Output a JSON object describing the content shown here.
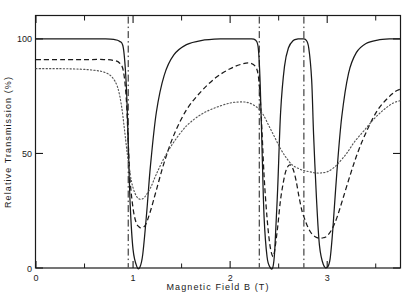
{
  "chart_data": {
    "type": "line",
    "title": "",
    "xlabel": "Magnetic Field B (T)",
    "ylabel": "Relative Transmission (%)",
    "xlim": [
      0,
      3.75
    ],
    "ylim": [
      0,
      110
    ],
    "xticks": [
      0,
      1,
      2,
      3
    ],
    "xticklabels": [
      "0",
      "1",
      "2",
      "3"
    ],
    "xminorticks": [
      0.5,
      1.5,
      2.5,
      3.5
    ],
    "yticks": [
      0,
      50,
      100
    ],
    "yticklabels": [
      "0",
      "50",
      "100"
    ],
    "grid": false,
    "legend": "none",
    "resonance_lines": {
      "style": "dash-dot",
      "values": [
        0.95,
        2.3,
        2.76
      ]
    },
    "series": [
      {
        "name": "solid",
        "style": "solid",
        "color": "#1a1a1a",
        "points": [
          [
            0.0,
            100
          ],
          [
            0.3,
            100
          ],
          [
            0.55,
            100
          ],
          [
            0.7,
            100
          ],
          [
            0.8,
            99.8
          ],
          [
            0.86,
            99.0
          ],
          [
            0.9,
            96
          ],
          [
            0.93,
            80
          ],
          [
            0.95,
            55
          ],
          [
            0.97,
            28
          ],
          [
            1.0,
            8
          ],
          [
            1.04,
            0.5
          ],
          [
            1.07,
            0.3
          ],
          [
            1.1,
            6
          ],
          [
            1.14,
            24
          ],
          [
            1.18,
            45
          ],
          [
            1.24,
            68
          ],
          [
            1.32,
            84
          ],
          [
            1.42,
            93
          ],
          [
            1.55,
            97.5
          ],
          [
            1.7,
            99.3
          ],
          [
            1.9,
            100
          ],
          [
            2.1,
            100
          ],
          [
            2.2,
            100
          ],
          [
            2.26,
            99.5
          ],
          [
            2.29,
            96
          ],
          [
            2.31,
            80
          ],
          [
            2.33,
            50
          ],
          [
            2.35,
            22
          ],
          [
            2.38,
            5
          ],
          [
            2.41,
            0.4
          ],
          [
            2.44,
            0.3
          ],
          [
            2.46,
            8
          ],
          [
            2.49,
            35
          ],
          [
            2.52,
            68
          ],
          [
            2.56,
            88
          ],
          [
            2.6,
            96
          ],
          [
            2.65,
            99.3
          ],
          [
            2.7,
            100
          ],
          [
            2.74,
            100
          ],
          [
            2.78,
            99.6
          ],
          [
            2.81,
            96
          ],
          [
            2.84,
            82
          ],
          [
            2.86,
            58
          ],
          [
            2.89,
            30
          ],
          [
            2.92,
            10
          ],
          [
            2.96,
            1.5
          ],
          [
            3.0,
            0.3
          ],
          [
            3.03,
            4
          ],
          [
            3.06,
            18
          ],
          [
            3.1,
            42
          ],
          [
            3.15,
            66
          ],
          [
            3.22,
            85
          ],
          [
            3.3,
            94
          ],
          [
            3.4,
            98
          ],
          [
            3.52,
            99.5
          ],
          [
            3.65,
            100
          ],
          [
            3.75,
            100
          ]
        ]
      },
      {
        "name": "dashed",
        "style": "dashed",
        "color": "#1a1a1a",
        "points": [
          [
            0.0,
            91
          ],
          [
            0.3,
            91
          ],
          [
            0.55,
            91
          ],
          [
            0.7,
            91
          ],
          [
            0.8,
            90.6
          ],
          [
            0.86,
            89.5
          ],
          [
            0.9,
            86
          ],
          [
            0.93,
            74
          ],
          [
            0.95,
            55
          ],
          [
            0.97,
            38
          ],
          [
            1.0,
            26
          ],
          [
            1.03,
            20
          ],
          [
            1.06,
            18
          ],
          [
            1.09,
            17.5
          ],
          [
            1.13,
            19
          ],
          [
            1.18,
            25
          ],
          [
            1.24,
            34
          ],
          [
            1.32,
            46
          ],
          [
            1.42,
            58
          ],
          [
            1.55,
            69
          ],
          [
            1.7,
            77
          ],
          [
            1.85,
            83
          ],
          [
            2.0,
            87
          ],
          [
            2.12,
            89
          ],
          [
            2.2,
            89.5
          ],
          [
            2.26,
            88
          ],
          [
            2.29,
            84
          ],
          [
            2.31,
            74
          ],
          [
            2.33,
            58
          ],
          [
            2.35,
            40
          ],
          [
            2.38,
            22
          ],
          [
            2.41,
            10
          ],
          [
            2.44,
            5
          ],
          [
            2.46,
            8
          ],
          [
            2.49,
            18
          ],
          [
            2.52,
            30
          ],
          [
            2.56,
            40
          ],
          [
            2.59,
            44
          ],
          [
            2.62,
            45
          ],
          [
            2.65,
            43
          ],
          [
            2.68,
            38
          ],
          [
            2.71,
            31
          ],
          [
            2.74,
            25
          ],
          [
            2.78,
            20
          ],
          [
            2.81,
            17
          ],
          [
            2.84,
            15
          ],
          [
            2.88,
            13.5
          ],
          [
            2.92,
            13
          ],
          [
            2.96,
            13.2
          ],
          [
            3.0,
            14
          ],
          [
            3.05,
            17
          ],
          [
            3.1,
            22
          ],
          [
            3.16,
            30
          ],
          [
            3.24,
            41
          ],
          [
            3.32,
            51
          ],
          [
            3.42,
            61
          ],
          [
            3.52,
            69
          ],
          [
            3.62,
            74
          ],
          [
            3.7,
            77
          ],
          [
            3.75,
            78
          ]
        ]
      },
      {
        "name": "dotted",
        "style": "dotted",
        "color": "#555555",
        "points": [
          [
            0.0,
            87
          ],
          [
            0.25,
            87
          ],
          [
            0.45,
            86.8
          ],
          [
            0.6,
            86.3
          ],
          [
            0.7,
            85.5
          ],
          [
            0.78,
            83.5
          ],
          [
            0.84,
            79
          ],
          [
            0.88,
            71
          ],
          [
            0.91,
            61
          ],
          [
            0.94,
            50
          ],
          [
            0.97,
            41
          ],
          [
            1.0,
            35
          ],
          [
            1.04,
            31
          ],
          [
            1.08,
            30
          ],
          [
            1.12,
            31
          ],
          [
            1.18,
            35
          ],
          [
            1.24,
            41
          ],
          [
            1.32,
            48
          ],
          [
            1.42,
            55
          ],
          [
            1.55,
            62
          ],
          [
            1.7,
            67
          ],
          [
            1.85,
            70
          ],
          [
            2.0,
            72
          ],
          [
            2.12,
            72.5
          ],
          [
            2.2,
            72
          ],
          [
            2.28,
            70
          ],
          [
            2.34,
            67
          ],
          [
            2.4,
            62
          ],
          [
            2.46,
            57
          ],
          [
            2.52,
            52
          ],
          [
            2.58,
            48
          ],
          [
            2.64,
            45
          ],
          [
            2.7,
            43.5
          ],
          [
            2.76,
            42.5
          ],
          [
            2.82,
            42
          ],
          [
            2.88,
            41.5
          ],
          [
            2.94,
            41.5
          ],
          [
            3.0,
            42
          ],
          [
            3.06,
            43.5
          ],
          [
            3.12,
            46
          ],
          [
            3.2,
            50
          ],
          [
            3.28,
            55
          ],
          [
            3.38,
            60
          ],
          [
            3.48,
            65
          ],
          [
            3.58,
            69
          ],
          [
            3.68,
            72
          ],
          [
            3.75,
            73
          ]
        ]
      }
    ]
  },
  "axes": {
    "frame_color": "#1a1a1a"
  }
}
